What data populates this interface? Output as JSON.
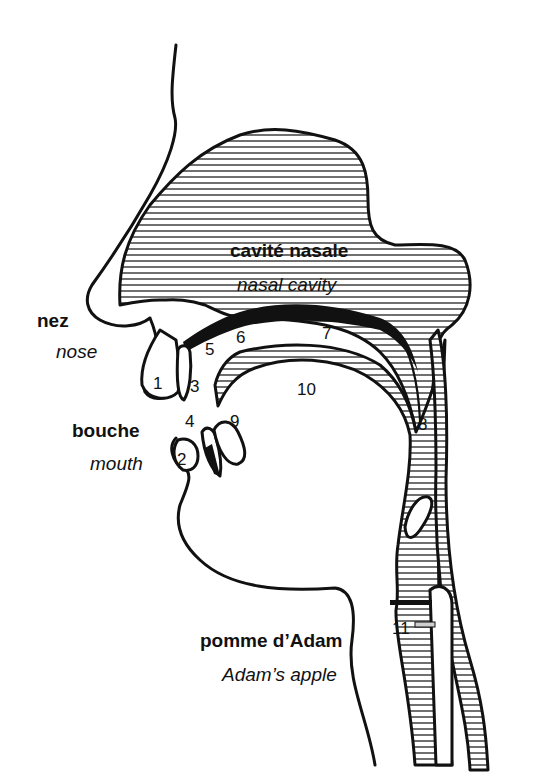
{
  "labels": {
    "nasal_cavity_fr": "cavité nasale",
    "nasal_cavity_en": "nasal cavity",
    "nose_fr": "nez",
    "nose_en": "nose",
    "mouth_fr": "bouche",
    "mouth_en": "mouth",
    "adams_apple_fr": "pomme d’Adam",
    "adams_apple_en": "Adam’s apple"
  },
  "numbers": {
    "n1": "1",
    "n2": "2",
    "n3": "3",
    "n4": "4",
    "n5": "5",
    "n6": "6",
    "n7": "7",
    "n8": "8",
    "n9": "9",
    "n10": "10",
    "n11": "11"
  },
  "colors": {
    "ink": "#111111",
    "paper": "#ffffff"
  }
}
